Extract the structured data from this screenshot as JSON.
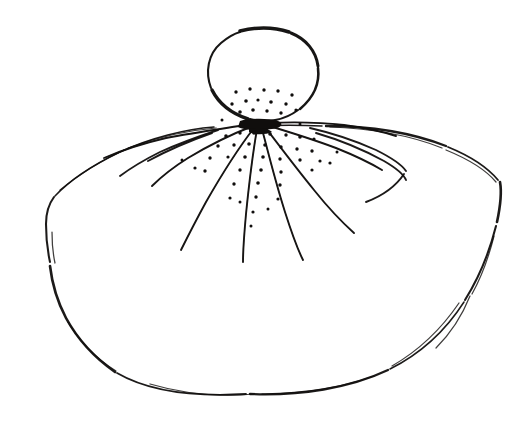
{
  "canvas": {
    "width": 528,
    "height": 428,
    "background_color": "#ffffff",
    "ink_color": "#100e0d",
    "medium": "pen-and-ink line drawing",
    "subject": "jellyfish-like bell form with radiating tentacle lines and stippling"
  },
  "figure": {
    "parts": [
      {
        "name": "head-bulb",
        "description": "small irregular circle at top center"
      },
      {
        "name": "bell-skirt",
        "description": "large fan / dome shape spreading below the head"
      },
      {
        "name": "radiating-lines",
        "description": "tentacle strokes fanning from a node under the head"
      },
      {
        "name": "stipple-dots",
        "description": "scattered ink dots clustered near the center"
      },
      {
        "name": "fold-lines",
        "description": "interior crease curves on left and right shoulders"
      }
    ]
  },
  "geometry": {
    "head": {
      "center_x": 262,
      "center_y": 73,
      "radius_x": 57,
      "radius_y": 47,
      "outline": "M 236 32 C 250 27, 272 26, 288 31 C 305 36, 317 49, 319 66 C 321 83, 314 98, 300 109 C 286 120, 266 124, 249 119 C 232 114, 216 103, 209 87 C 202 70, 206 52, 219 41 C 224 36, 230 33, 236 32 Z",
      "outline_segments": [
        "M 211 88 C 205 72, 208 54, 221 43 C 227 38, 233 34, 240 32",
        "M 240 31 C 256 27, 274 27, 289 32",
        "M 291 33 C 306 39, 316 51, 318 66",
        "M 318 68 C 320 84, 313 98, 300 109",
        "M 298 110 C 285 120, 266 124, 250 119",
        "M 248 119 C 233 114, 219 104, 212 90"
      ]
    },
    "bell": {
      "left_x": 46,
      "right_x": 504,
      "top_y": 126,
      "bottom_y": 392,
      "apex_x": 258,
      "outline_segments": [
        "M 214 127 C 186 129, 150 138, 120 152 C 95 164, 70 180, 55 196",
        "M 54 197 C 48 205, 46 214, 46 224 C 46 240, 48 253, 50 262",
        "M 50 266 C 52 283, 57 301, 66 318 C 78 340, 95 358, 115 372",
        "M 117 373 C 148 391, 195 397, 246 394",
        "M 250 394 C 300 396, 350 388, 388 370",
        "M 390 369 C 420 354, 446 330, 464 302",
        "M 465 300 C 480 276, 490 250, 496 226",
        "M 497 222 C 500 208, 502 193, 500 182",
        "M 498 180 C 488 168, 470 156, 448 147",
        "M 446 146 C 410 132, 366 126, 326 126",
        "M 322 126 C 300 125, 278 125, 258 126"
      ],
      "accent_strokes": [
        "M 60 190 C 77 176, 100 161, 124 150",
        "M 128 148 C 160 136, 192 130, 216 128",
        "M 330 127 C 368 128, 410 135, 442 148",
        "M 446 150 C 468 159, 486 170, 496 182",
        "M 52 232 C 52 244, 53 254, 55 263",
        "M 494 236 C 489 256, 482 276, 472 294",
        "M 68 322 C 80 342, 97 359, 116 371",
        "M 392 366 C 418 351, 442 328, 459 303",
        "M 150 384 C 184 394, 222 397, 254 394",
        "M 262 394 C 300 394, 340 388, 374 376",
        "M 470 296 C 462 316, 450 334, 436 348"
      ]
    },
    "node": {
      "x": 258,
      "y": 125
    },
    "tentacles": [
      {
        "id": 1,
        "path": "M 252 124 C 228 128, 196 132, 166 138 C 140 144, 118 152, 104 158"
      },
      {
        "id": 2,
        "path": "M 253 126 C 232 134, 208 146, 188 158 C 172 168, 160 178, 152 186"
      },
      {
        "id": 3,
        "path": "M 254 128 C 240 146, 222 174, 206 202 C 194 224, 186 240, 181 250"
      },
      {
        "id": 4,
        "path": "M 257 129 C 253 152, 249 184, 246 214 C 244 236, 243 252, 243 262"
      },
      {
        "id": 5,
        "path": "M 262 129 C 268 152, 276 184, 285 212 C 292 234, 298 250, 303 260"
      },
      {
        "id": 6,
        "path": "M 265 127 C 278 144, 296 168, 314 190 C 330 210, 344 224, 354 233"
      },
      {
        "id": 7,
        "path": "M 266 125 C 286 131, 312 139, 336 148 C 356 156, 372 164, 382 170"
      },
      {
        "id": 8,
        "path": "M 267 123 C 290 122, 318 122, 344 125 C 366 128, 384 132, 396 136"
      }
    ],
    "fold_lines": [
      {
        "id": "left-fold",
        "path": "M 218 130 C 200 136, 178 144, 160 152 C 142 161, 128 170, 120 176"
      },
      {
        "id": "left-fold-2",
        "path": "M 212 133 C 192 140, 168 150, 148 161"
      },
      {
        "id": "right-fold",
        "path": "M 310 128 C 332 133, 356 141, 376 150 C 392 158, 402 165, 406 171"
      },
      {
        "id": "right-fold-2",
        "path": "M 316 133 C 340 140, 364 150, 384 161 C 396 168, 404 175, 406 180"
      },
      {
        "id": "right-fold-3",
        "path": "M 404 174 C 396 186, 382 196, 366 202"
      }
    ],
    "stipple_dots": [
      {
        "x": 236,
        "y": 92,
        "r": 1.7
      },
      {
        "x": 250,
        "y": 89,
        "r": 1.7
      },
      {
        "x": 264,
        "y": 90,
        "r": 1.7
      },
      {
        "x": 278,
        "y": 91,
        "r": 1.7
      },
      {
        "x": 292,
        "y": 95,
        "r": 1.7
      },
      {
        "x": 232,
        "y": 104,
        "r": 1.7
      },
      {
        "x": 246,
        "y": 101,
        "r": 1.8
      },
      {
        "x": 258,
        "y": 100,
        "r": 1.6
      },
      {
        "x": 271,
        "y": 102,
        "r": 1.8
      },
      {
        "x": 286,
        "y": 104,
        "r": 1.7
      },
      {
        "x": 240,
        "y": 112,
        "r": 1.8
      },
      {
        "x": 253,
        "y": 110,
        "r": 1.8
      },
      {
        "x": 267,
        "y": 111,
        "r": 1.7
      },
      {
        "x": 281,
        "y": 113,
        "r": 1.7
      },
      {
        "x": 296,
        "y": 110,
        "r": 1.6
      },
      {
        "x": 226,
        "y": 136,
        "r": 1.8
      },
      {
        "x": 240,
        "y": 133,
        "r": 1.7
      },
      {
        "x": 254,
        "y": 133,
        "r": 1.8
      },
      {
        "x": 270,
        "y": 134,
        "r": 1.8
      },
      {
        "x": 286,
        "y": 135,
        "r": 1.7
      },
      {
        "x": 300,
        "y": 137,
        "r": 1.8
      },
      {
        "x": 314,
        "y": 139,
        "r": 1.6
      },
      {
        "x": 218,
        "y": 146,
        "r": 1.7
      },
      {
        "x": 234,
        "y": 145,
        "r": 1.7
      },
      {
        "x": 249,
        "y": 144,
        "r": 1.8
      },
      {
        "x": 265,
        "y": 145,
        "r": 1.8
      },
      {
        "x": 281,
        "y": 147,
        "r": 1.7
      },
      {
        "x": 297,
        "y": 149,
        "r": 1.7
      },
      {
        "x": 312,
        "y": 151,
        "r": 1.7
      },
      {
        "x": 210,
        "y": 158,
        "r": 1.7
      },
      {
        "x": 228,
        "y": 157,
        "r": 1.6
      },
      {
        "x": 245,
        "y": 157,
        "r": 1.8
      },
      {
        "x": 263,
        "y": 157,
        "r": 1.8
      },
      {
        "x": 280,
        "y": 159,
        "r": 1.7
      },
      {
        "x": 300,
        "y": 160,
        "r": 1.7
      },
      {
        "x": 320,
        "y": 161,
        "r": 1.6
      },
      {
        "x": 205,
        "y": 171,
        "r": 1.7
      },
      {
        "x": 240,
        "y": 170,
        "r": 1.7
      },
      {
        "x": 261,
        "y": 170,
        "r": 1.8
      },
      {
        "x": 281,
        "y": 172,
        "r": 1.7
      },
      {
        "x": 312,
        "y": 170,
        "r": 1.6
      },
      {
        "x": 234,
        "y": 184,
        "r": 1.7
      },
      {
        "x": 258,
        "y": 183,
        "r": 1.8
      },
      {
        "x": 280,
        "y": 185,
        "r": 1.7
      },
      {
        "x": 330,
        "y": 163,
        "r": 1.6
      },
      {
        "x": 230,
        "y": 198,
        "r": 1.6
      },
      {
        "x": 256,
        "y": 197,
        "r": 1.7
      },
      {
        "x": 278,
        "y": 199,
        "r": 1.6
      },
      {
        "x": 253,
        "y": 212,
        "r": 1.6
      },
      {
        "x": 240,
        "y": 202,
        "r": 1.5
      },
      {
        "x": 268,
        "y": 209,
        "r": 1.5
      },
      {
        "x": 251,
        "y": 226,
        "r": 1.5
      },
      {
        "x": 195,
        "y": 168,
        "r": 1.6
      },
      {
        "x": 182,
        "y": 160,
        "r": 1.5
      },
      {
        "x": 337,
        "y": 152,
        "r": 1.5
      },
      {
        "x": 222,
        "y": 120,
        "r": 1.5
      },
      {
        "x": 300,
        "y": 124,
        "r": 1.5
      }
    ],
    "ink_blobs": [
      {
        "path": "M 240 121 C 250 118, 268 118, 278 121 C 284 123, 282 128, 272 129 C 258 131, 244 130, 238 127 Z"
      },
      {
        "path": "M 249 129 C 258 127, 268 128, 272 132 C 266 135, 254 135, 249 132 Z"
      }
    ]
  }
}
